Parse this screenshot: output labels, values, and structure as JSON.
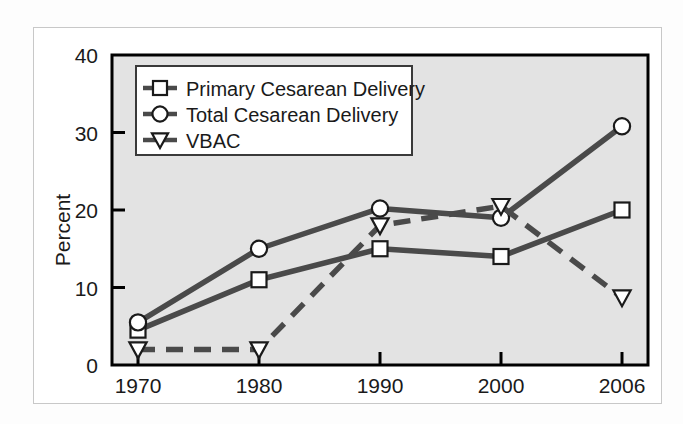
{
  "figure": {
    "background_color": "#fdfdfd",
    "outer_frame_color": "#c8c8c8",
    "plot_background_color": "#e3e3e3",
    "axis_color": "#000000",
    "series_color": "#4a4a4a",
    "marker_fill": "#ffffff"
  },
  "chart_data": {
    "type": "line",
    "title": "",
    "xlabel": "",
    "ylabel": "Percent",
    "categories": [
      "1970",
      "1980",
      "1990",
      "2000",
      "2006"
    ],
    "x": [
      1970,
      1980,
      1990,
      2000,
      2006
    ],
    "ylim": [
      0,
      40
    ],
    "yticks": [
      0,
      10,
      20,
      30,
      40
    ],
    "ytick_labels": [
      "0",
      "10",
      "20",
      "30",
      "40"
    ],
    "xtick_labels": [
      "1970",
      "1980",
      "1990",
      "2000",
      "2006"
    ],
    "grid": false,
    "legend_position": "upper left",
    "series": [
      {
        "name": "Primary Cesarean Delivery",
        "marker": "square",
        "linestyle": "solid",
        "values": [
          4.5,
          11,
          15,
          14,
          20
        ]
      },
      {
        "name": "Total Cesarean Delivery",
        "marker": "circle",
        "linestyle": "solid",
        "values": [
          5.5,
          15,
          20.2,
          19,
          30.8
        ]
      },
      {
        "name": "VBAC",
        "marker": "triangle-down",
        "linestyle": "dashed",
        "values": [
          2,
          2,
          18,
          20.5,
          8.7
        ]
      }
    ]
  },
  "legend": {
    "items": [
      {
        "label": "Primary Cesarean Delivery",
        "marker": "square"
      },
      {
        "label": "Total Cesarean Delivery",
        "marker": "circle"
      },
      {
        "label": "VBAC",
        "marker": "triangle-down"
      }
    ]
  }
}
